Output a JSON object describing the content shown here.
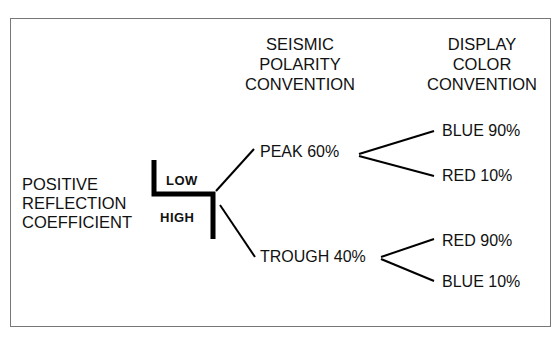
{
  "diagram": {
    "headers": {
      "seismic": "SEISMIC\nPOLARITY\nCONVENTION",
      "display": "DISPLAY\nCOLOR\nCONVENTION"
    },
    "root": "POSITIVE\nREFLECTION\nCOEFFICIENT",
    "impedance": {
      "low": "LOW",
      "high": "HIGH"
    },
    "polarity": [
      {
        "label": "PEAK 60%",
        "colors": [
          "BLUE 90%",
          "RED 10%"
        ]
      },
      {
        "label": "TROUGH 40%",
        "colors": [
          "RED 90%",
          "BLUE 10%"
        ]
      }
    ],
    "line_color": "#000000",
    "frame_color": "#777777"
  }
}
